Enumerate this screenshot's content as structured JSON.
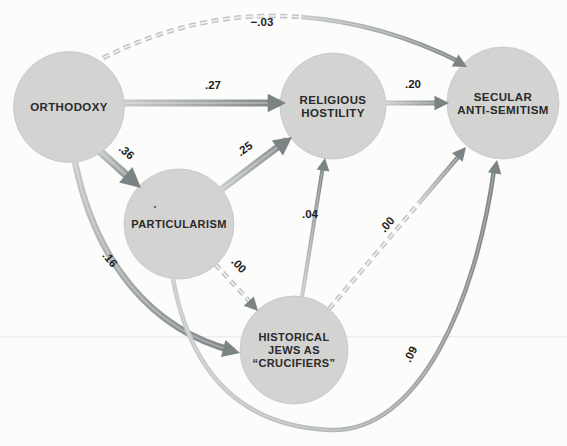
{
  "figure": {
    "type": "path-diagram",
    "colors": {
      "background": "#fcfcfb",
      "node_fill": "#d3d3d2",
      "node_stroke": "#c4c4c3",
      "arrow_dark": "#7c8385",
      "arrow_light": "#c8cbcc",
      "dash_color": "#bdc0c1",
      "dash_core": "#edeeee",
      "label_color": "#1e1e1e"
    },
    "nodes": [
      {
        "id": "orthodoxy",
        "label_lines": [
          "ORTHODOXY"
        ]
      },
      {
        "id": "particularism",
        "label_lines": [
          "PARTICULARISM"
        ]
      },
      {
        "id": "religious_hostility",
        "label_lines": [
          "RELIGIOUS",
          "HOSTILITY"
        ]
      },
      {
        "id": "historical_jews",
        "label_lines": [
          "HISTORICAL",
          "JEWS AS",
          "“CRUCIFIERS”"
        ]
      },
      {
        "id": "secular_anti_semitism",
        "label_lines": [
          "SECULAR",
          "ANTI-SEMITISM"
        ]
      }
    ],
    "edges": [
      {
        "from": "orthodoxy",
        "to": "religious_hostility",
        "coefficient": ".27",
        "style": "solid"
      },
      {
        "from": "orthodoxy",
        "to": "particularism",
        "coefficient": ".36",
        "style": "solid"
      },
      {
        "from": "orthodoxy",
        "to": "secular_anti_semitism",
        "coefficient": "−.03",
        "style": "dashed"
      },
      {
        "from": "orthodoxy",
        "to": "historical_jews",
        "coefficient": ".16",
        "style": "solid"
      },
      {
        "from": "particularism",
        "to": "religious_hostility",
        "coefficient": ".25",
        "style": "solid"
      },
      {
        "from": "particularism",
        "to": "historical_jews",
        "coefficient": ".00",
        "style": "dashed"
      },
      {
        "from": "historical_jews",
        "to": "religious_hostility",
        "coefficient": ".04",
        "style": "solid"
      },
      {
        "from": "historical_jews",
        "to": "secular_anti_semitism",
        "coefficient": ".00",
        "style": "dashed"
      },
      {
        "from": "particularism",
        "to": "secular_anti_semitism",
        "coefficient": ".09",
        "style": "solid"
      },
      {
        "from": "religious_hostility",
        "to": "secular_anti_semitism",
        "coefficient": ".20",
        "style": "solid"
      }
    ]
  }
}
